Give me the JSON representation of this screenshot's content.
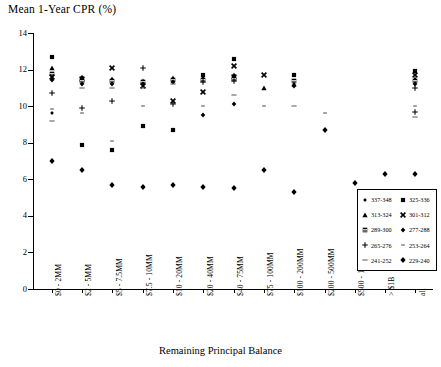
{
  "chart_data": {
    "type": "scatter",
    "title": "Mean 1-Year CPR (%)",
    "xlabel": "Remaining Principal Balance",
    "ylabel": "Mean 1-Year CPR (%)",
    "ylim": [
      0,
      14
    ],
    "yticks": [
      0,
      2,
      4,
      6,
      8,
      10,
      12,
      14
    ],
    "ytick_labels": [
      "0",
      "2",
      "4",
      "6",
      "8",
      "10",
      "12",
      "14"
    ],
    "grid": false,
    "legend_position": "inside-bottom-right",
    "categories": [
      "$0 - 2MM",
      "$2 - 5MM",
      "$5 - 7.5MM",
      "$7.5 - 10MM",
      "$10 - 20MM",
      "$20 - 40MM",
      "$40 - 75MM",
      "$75 - 100MM",
      "$100 - 200MM",
      "$200 - 500MM",
      "$500 - 1B",
      "> $1B",
      "all"
    ],
    "series": [
      {
        "name": "337-348",
        "marker": "diamond-small",
        "values": [
          9.8,
          10.0,
          10.3,
          10.1,
          11.3,
          11.4,
          11.6,
          11.7,
          11.7,
          null,
          null,
          null,
          11.3
        ]
      },
      {
        "name": "325-336",
        "marker": "square",
        "values": [
          12.7,
          7.9,
          7.6,
          8.9,
          8.7,
          5.8,
          5.5,
          11.1,
          10.9,
          null,
          null,
          null,
          9.8
        ]
      },
      {
        "name": "313-324",
        "marker": "triangle",
        "values": [
          12.1,
          11.5,
          11.4,
          11.3,
          11.4,
          11.6,
          11.6,
          11.6,
          11.7,
          null,
          null,
          null,
          11.9
        ]
      },
      {
        "name": "301-312",
        "marker": "x",
        "values": [
          11.6,
          11.6,
          12.1,
          11.4,
          10.2,
          10.8,
          10.7,
          11.5,
          11.6,
          null,
          null,
          null,
          11.4
        ]
      },
      {
        "name": "289-300",
        "marker": "square-hatched",
        "values": [
          11.7,
          11.5,
          11.3,
          11.3,
          11.4,
          11.4,
          11.5,
          11.4,
          11.5,
          null,
          null,
          null,
          11.6
        ]
      },
      {
        "name": "277-288",
        "marker": "diamond",
        "values": [
          11.6,
          11.5,
          11.4,
          11.4,
          11.5,
          11.5,
          11.6,
          11.5,
          11.7,
          11.6,
          null,
          null,
          11.5
        ]
      },
      {
        "name": "265-276",
        "marker": "plus",
        "values": [
          10.7,
          9.7,
          10.3,
          12.1,
          11.3,
          11.4,
          11.5,
          11.3,
          11.6,
          null,
          null,
          null,
          11.0
        ]
      },
      {
        "name": "253-264",
        "marker": "dash-small",
        "values": [
          9.6,
          9.9,
          8.1,
          9.9,
          10.9,
          11.3,
          11.2,
          10.2,
          9.9,
          9.6,
          null,
          null,
          10.0
        ]
      },
      {
        "name": "241-252",
        "marker": "dash",
        "values": [
          9.4,
          11.2,
          11.2,
          10.1,
          11.0,
          11.4,
          11.4,
          11.3,
          11.3,
          null,
          null,
          null,
          9.6
        ]
      },
      {
        "name": "229-240",
        "marker": "diamond-filled",
        "values": [
          7.0,
          6.5,
          5.7,
          5.6,
          5.7,
          5.6,
          5.5,
          6.5,
          5.3,
          8.7,
          5.8,
          6.3,
          6.3
        ]
      }
    ],
    "points": [
      {
        "x": 0,
        "y": 12.7,
        "marker": "square"
      },
      {
        "x": 0,
        "y": 12.1,
        "marker": "triangle"
      },
      {
        "x": 0,
        "y": 11.75,
        "marker": "square-hatched"
      },
      {
        "x": 0,
        "y": 11.6,
        "marker": "x"
      },
      {
        "x": 0,
        "y": 11.45,
        "marker": "diamond"
      },
      {
        "x": 0,
        "y": 10.7,
        "marker": "plus"
      },
      {
        "x": 0,
        "y": 9.85,
        "marker": "dash-small"
      },
      {
        "x": 0,
        "y": 9.6,
        "marker": "diamond-small"
      },
      {
        "x": 0,
        "y": 9.2,
        "marker": "dash"
      },
      {
        "x": 0,
        "y": 7.0,
        "marker": "diamond-filled"
      },
      {
        "x": 1,
        "y": 11.6,
        "marker": "triangle"
      },
      {
        "x": 1,
        "y": 11.5,
        "marker": "x"
      },
      {
        "x": 1,
        "y": 11.35,
        "marker": "square-hatched"
      },
      {
        "x": 1,
        "y": 11.2,
        "marker": "diamond"
      },
      {
        "x": 1,
        "y": 11.0,
        "marker": "dash"
      },
      {
        "x": 1,
        "y": 9.9,
        "marker": "plus"
      },
      {
        "x": 1,
        "y": 9.6,
        "marker": "dash-small"
      },
      {
        "x": 1,
        "y": 7.9,
        "marker": "square"
      },
      {
        "x": 1,
        "y": 6.5,
        "marker": "diamond-filled"
      },
      {
        "x": 2,
        "y": 12.1,
        "marker": "x"
      },
      {
        "x": 2,
        "y": 11.5,
        "marker": "triangle"
      },
      {
        "x": 2,
        "y": 11.35,
        "marker": "square-hatched"
      },
      {
        "x": 2,
        "y": 11.2,
        "marker": "diamond"
      },
      {
        "x": 2,
        "y": 11.0,
        "marker": "dash"
      },
      {
        "x": 2,
        "y": 10.3,
        "marker": "plus"
      },
      {
        "x": 2,
        "y": 8.1,
        "marker": "dash-small"
      },
      {
        "x": 2,
        "y": 7.6,
        "marker": "square"
      },
      {
        "x": 2,
        "y": 5.7,
        "marker": "diamond-filled"
      },
      {
        "x": 3,
        "y": 12.1,
        "marker": "plus"
      },
      {
        "x": 3,
        "y": 11.4,
        "marker": "triangle"
      },
      {
        "x": 3,
        "y": 11.3,
        "marker": "square-hatched"
      },
      {
        "x": 3,
        "y": 11.2,
        "marker": "diamond"
      },
      {
        "x": 3,
        "y": 11.1,
        "marker": "x"
      },
      {
        "x": 3,
        "y": 11.0,
        "marker": "dash"
      },
      {
        "x": 3,
        "y": 10.0,
        "marker": "dash-small"
      },
      {
        "x": 3,
        "y": 8.9,
        "marker": "square"
      },
      {
        "x": 3,
        "y": 5.6,
        "marker": "diamond-filled"
      },
      {
        "x": 4,
        "y": 11.55,
        "marker": "triangle"
      },
      {
        "x": 4,
        "y": 11.45,
        "marker": "square-hatched"
      },
      {
        "x": 4,
        "y": 11.3,
        "marker": "diamond"
      },
      {
        "x": 4,
        "y": 11.2,
        "marker": "dash"
      },
      {
        "x": 4,
        "y": 10.3,
        "marker": "x"
      },
      {
        "x": 4,
        "y": 10.1,
        "marker": "plus"
      },
      {
        "x": 4,
        "y": 8.7,
        "marker": "square"
      },
      {
        "x": 4,
        "y": 5.7,
        "marker": "diamond-filled"
      },
      {
        "x": 5,
        "y": 11.7,
        "marker": "square"
      },
      {
        "x": 5,
        "y": 11.55,
        "marker": "triangle"
      },
      {
        "x": 5,
        "y": 11.45,
        "marker": "square-hatched"
      },
      {
        "x": 5,
        "y": 11.3,
        "marker": "plus"
      },
      {
        "x": 5,
        "y": 10.8,
        "marker": "x"
      },
      {
        "x": 5,
        "y": 10.0,
        "marker": "dash-small"
      },
      {
        "x": 5,
        "y": 9.5,
        "marker": "diamond"
      },
      {
        "x": 5,
        "y": 5.6,
        "marker": "diamond-filled"
      },
      {
        "x": 6,
        "y": 12.6,
        "marker": "square"
      },
      {
        "x": 6,
        "y": 12.2,
        "marker": "x"
      },
      {
        "x": 6,
        "y": 11.7,
        "marker": "triangle"
      },
      {
        "x": 6,
        "y": 11.6,
        "marker": "x"
      },
      {
        "x": 6,
        "y": 11.5,
        "marker": "square-hatched"
      },
      {
        "x": 6,
        "y": 11.35,
        "marker": "plus"
      },
      {
        "x": 6,
        "y": 10.6,
        "marker": "dash"
      },
      {
        "x": 6,
        "y": 10.1,
        "marker": "diamond"
      },
      {
        "x": 6,
        "y": 5.5,
        "marker": "diamond-filled"
      },
      {
        "x": 7,
        "y": 11.7,
        "marker": "x"
      },
      {
        "x": 7,
        "y": 11.0,
        "marker": "triangle"
      },
      {
        "x": 7,
        "y": 10.0,
        "marker": "dash-small"
      },
      {
        "x": 7,
        "y": 6.5,
        "marker": "diamond-filled"
      },
      {
        "x": 8,
        "y": 11.7,
        "marker": "square"
      },
      {
        "x": 8,
        "y": 11.35,
        "marker": "square-hatched"
      },
      {
        "x": 8,
        "y": 11.2,
        "marker": "triangle"
      },
      {
        "x": 8,
        "y": 11.1,
        "marker": "diamond"
      },
      {
        "x": 8,
        "y": 10.0,
        "marker": "dash"
      },
      {
        "x": 8,
        "y": 5.3,
        "marker": "diamond-filled"
      },
      {
        "x": 9,
        "y": 9.6,
        "marker": "dash-small"
      },
      {
        "x": 9,
        "y": 8.7,
        "marker": "diamond-filled"
      },
      {
        "x": 10,
        "y": 5.8,
        "marker": "diamond-filled"
      },
      {
        "x": 11,
        "y": 6.3,
        "marker": "diamond-filled"
      },
      {
        "x": 12,
        "y": 11.9,
        "marker": "square"
      },
      {
        "x": 12,
        "y": 11.7,
        "marker": "x"
      },
      {
        "x": 12,
        "y": 11.5,
        "marker": "triangle"
      },
      {
        "x": 12,
        "y": 11.35,
        "marker": "square-hatched"
      },
      {
        "x": 12,
        "y": 11.2,
        "marker": "diamond"
      },
      {
        "x": 12,
        "y": 11.0,
        "marker": "plus"
      },
      {
        "x": 12,
        "y": 10.0,
        "marker": "dash-small"
      },
      {
        "x": 12,
        "y": 9.7,
        "marker": "plus"
      },
      {
        "x": 12,
        "y": 9.4,
        "marker": "dash"
      },
      {
        "x": 12,
        "y": 6.3,
        "marker": "diamond-filled"
      }
    ]
  },
  "legend": {
    "entries": [
      {
        "label": "337-348",
        "marker": "diamond-small"
      },
      {
        "label": "325-336",
        "marker": "square"
      },
      {
        "label": "313-324",
        "marker": "triangle"
      },
      {
        "label": "301-312",
        "marker": "x"
      },
      {
        "label": "289-300",
        "marker": "square-hatched"
      },
      {
        "label": "277-288",
        "marker": "diamond"
      },
      {
        "label": "265-276",
        "marker": "plus"
      },
      {
        "label": "253-264",
        "marker": "dash-small"
      },
      {
        "label": "241-252",
        "marker": "dash"
      },
      {
        "label": "229-240",
        "marker": "diamond-filled"
      }
    ]
  }
}
